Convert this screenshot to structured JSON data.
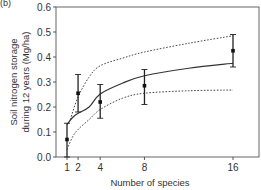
{
  "panel_label": "(b)",
  "chart_data": {
    "type": "line",
    "title": "",
    "xlabel": "Number of species",
    "ylabel_lines": [
      "Soil nitrogen storage",
      "during 12 years (Mg/ha)"
    ],
    "ylabel": "Soil nitrogen storage during 12 years (Mg/ha)",
    "xlim": [
      0,
      17.5
    ],
    "ylim": [
      0.0,
      0.6
    ],
    "x_ticks": [
      1,
      2,
      4,
      8,
      16
    ],
    "x_tick_labels": [
      "1",
      "2",
      "4",
      "8",
      "16"
    ],
    "y_ticks": [
      0.0,
      0.1,
      0.2,
      0.3,
      0.4,
      0.5,
      0.6
    ],
    "y_tick_labels": [
      "0.0",
      "0.1",
      "0.2",
      "0.3",
      "0.4",
      "0.5",
      "0.6"
    ],
    "grid": false,
    "legend": null,
    "points": {
      "name": "Observed mean ± error",
      "x": [
        1,
        2,
        4,
        8,
        16
      ],
      "y": [
        0.07,
        0.255,
        0.22,
        0.285,
        0.425
      ],
      "err_low": [
        0.0,
        0.18,
        0.155,
        0.21,
        0.36
      ],
      "err_high": [
        0.135,
        0.33,
        0.29,
        0.35,
        0.49
      ]
    },
    "series": [
      {
        "name": "Fitted curve",
        "style": "solid",
        "x": [
          1,
          1.5,
          2,
          3,
          4,
          6,
          8,
          12,
          16
        ],
        "y": [
          0.13,
          0.158,
          0.175,
          0.2,
          0.252,
          0.295,
          0.325,
          0.355,
          0.375
        ]
      },
      {
        "name": "Upper confidence band",
        "style": "dotted",
        "x": [
          1.3,
          2,
          3,
          4,
          6,
          8,
          12,
          16
        ],
        "y": [
          0.15,
          0.24,
          0.32,
          0.365,
          0.395,
          0.42,
          0.455,
          0.485
        ]
      },
      {
        "name": "Lower confidence band",
        "style": "dotted",
        "x": [
          1,
          1.5,
          2,
          3,
          4,
          6,
          8,
          12,
          16
        ],
        "y": [
          0.03,
          0.08,
          0.11,
          0.15,
          0.19,
          0.235,
          0.255,
          0.265,
          0.268
        ]
      }
    ]
  }
}
